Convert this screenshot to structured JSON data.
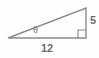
{
  "figure": {
    "kind": "right-triangle-diagram",
    "background_color": "#fefefe",
    "stroke_color": "#8a8a8a",
    "label_color": "#6e6e6e",
    "labels": {
      "angle": "θ",
      "base": "12",
      "height": "5"
    },
    "geometry": {
      "left_vertex": [
        8,
        38
      ],
      "right_angle_vertex": [
        86,
        38
      ],
      "top_vertex": [
        86,
        8
      ],
      "base_length_label": "12",
      "height_length_label": "5",
      "angle_label": "θ",
      "right_angle_marker": true
    }
  }
}
